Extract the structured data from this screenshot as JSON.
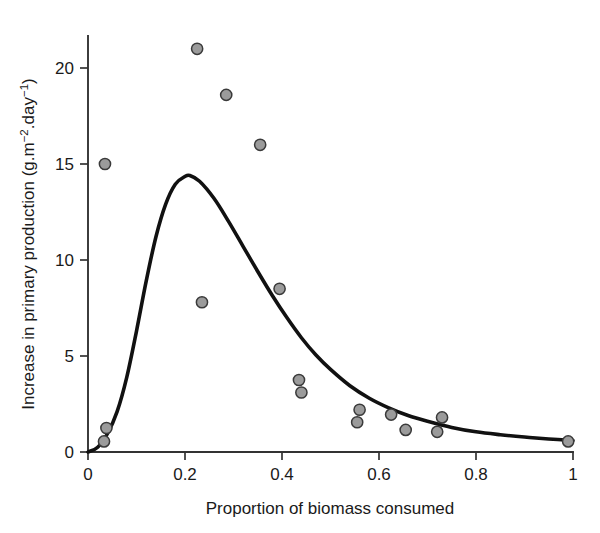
{
  "chart_data": {
    "type": "scatter",
    "title": "",
    "xlabel": "Proportion of biomass consumed",
    "ylabel": "Increase in primary production (g.m⁻².day⁻¹)",
    "ylabel_parts": {
      "main": "Increase in primary production (g.m",
      "sup1": "−2",
      "mid": ".day",
      "sup2": "−1",
      "tail": ")"
    },
    "xlim": [
      0,
      1
    ],
    "ylim": [
      0,
      22
    ],
    "grid": false,
    "legend": "none",
    "xticks": [
      "0",
      "0.2",
      "0.4",
      "0.6",
      "0.8",
      "1"
    ],
    "xtick_values": [
      0,
      0.2,
      0.4,
      0.6,
      0.8,
      1
    ],
    "yticks": [
      "0",
      "5",
      "10",
      "15",
      "20"
    ],
    "ytick_values": [
      0,
      5,
      10,
      15,
      20
    ],
    "series": [
      {
        "name": "observations",
        "marker": "filled-circle",
        "marker_color": "#9b9b9b",
        "marker_edge_color": "#3a3a3a",
        "x": [
          0.033,
          0.038,
          0.035,
          0.225,
          0.285,
          0.355,
          0.235,
          0.395,
          0.435,
          0.44,
          0.555,
          0.56,
          0.625,
          0.655,
          0.72,
          0.73,
          0.99
        ],
        "y": [
          0.55,
          1.25,
          15.0,
          21.0,
          18.6,
          16.0,
          7.8,
          8.5,
          3.75,
          3.1,
          1.55,
          2.2,
          1.95,
          1.15,
          1.05,
          1.8,
          0.55
        ]
      },
      {
        "name": "fitted-curve",
        "marker": "none",
        "line_color": "#111111",
        "x": [
          0.0,
          0.02,
          0.04,
          0.06,
          0.08,
          0.1,
          0.12,
          0.14,
          0.16,
          0.18,
          0.2,
          0.21,
          0.23,
          0.26,
          0.29,
          0.32,
          0.35,
          0.38,
          0.41,
          0.44,
          0.47,
          0.5,
          0.54,
          0.58,
          0.62,
          0.66,
          0.7,
          0.75,
          0.8,
          0.85,
          0.9,
          0.95,
          1.0
        ],
        "y": [
          0.0,
          0.25,
          0.95,
          2.1,
          3.9,
          6.3,
          8.9,
          11.2,
          12.9,
          13.95,
          14.35,
          14.4,
          14.1,
          13.2,
          12.0,
          10.7,
          9.4,
          8.15,
          7.0,
          5.95,
          5.05,
          4.3,
          3.45,
          2.8,
          2.3,
          1.9,
          1.6,
          1.28,
          1.05,
          0.9,
          0.78,
          0.68,
          0.6
        ]
      }
    ]
  },
  "axes_geometry": {
    "x0_px": 88,
    "x1_px": 573,
    "y0_px": 452,
    "ytop_px": 36
  }
}
